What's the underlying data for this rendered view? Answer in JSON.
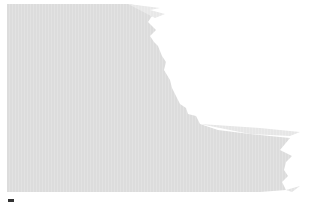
{
  "image": {
    "description": "Abstract light gray brushed texture shape on white background",
    "colors": {
      "background": "#ffffff",
      "shape_fill": "#dcdcdc",
      "shape_edge": "#e8e8e8",
      "mark": "#333333"
    }
  }
}
